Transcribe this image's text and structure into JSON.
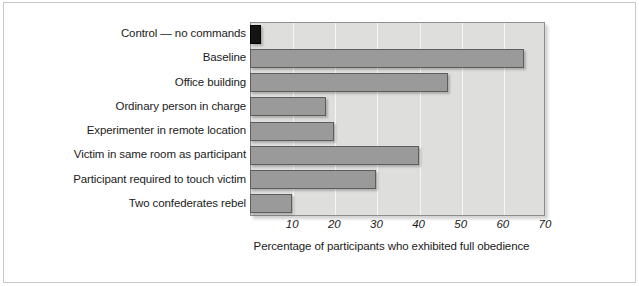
{
  "chart_data": {
    "type": "bar",
    "orientation": "horizontal",
    "title": "",
    "subtitle": "",
    "xlabel": "Percentage of participants who exhibited full obedience",
    "ylabel": "",
    "xlim": [
      0,
      70
    ],
    "xticks": [
      10,
      20,
      30,
      40,
      50,
      60,
      70
    ],
    "xtick_labels": [
      "10",
      "20",
      "30",
      "40",
      "50",
      "60",
      "70"
    ],
    "grid": "vertical",
    "legend": "none",
    "categories": [
      "Control — no commands",
      "Baseline",
      "Office building",
      "Ordinary person in charge",
      "Experimenter in remote location",
      "Victim in same room as participant",
      "Participant required to touch victim",
      "Two confederates rebel"
    ],
    "values": [
      2.5,
      65,
      47,
      18,
      20,
      40,
      30,
      10
    ],
    "bar_colors": [
      "#141414",
      "#9a9a9a",
      "#9a9a9a",
      "#9a9a9a",
      "#9a9a9a",
      "#9a9a9a",
      "#9a9a9a",
      "#9a9a9a"
    ],
    "plot_background": "#dededc",
    "gridline_color": "#f6f6f4",
    "axis_color": "#8d8d8d"
  }
}
